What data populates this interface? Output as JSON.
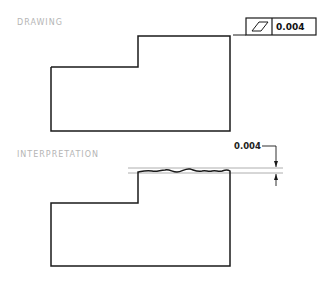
{
  "sections": {
    "drawing": {
      "label": "DRAWING"
    },
    "interpretation": {
      "label": "INTERPRETATION"
    }
  },
  "feature_control_frame": {
    "symbol": "flatness-icon",
    "tolerance": "0.004"
  },
  "dimension": {
    "value": "0.004"
  },
  "colors": {
    "line": "#1a1a1a",
    "tolerance_zone": "#9a9a9a",
    "label": "#b5b5b5"
  }
}
